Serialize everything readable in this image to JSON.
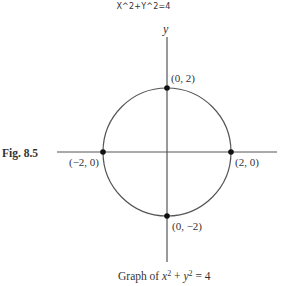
{
  "top_title": "X^2+Y^2=4",
  "figure": {
    "label": "Fig. 8.5",
    "axis_y_label": "y",
    "equation": "x^2 + y^2 = 4",
    "radius": 2,
    "center": [
      0,
      0
    ],
    "points": [
      {
        "label": "(0, 2)",
        "x": 0,
        "y": 2
      },
      {
        "label": "(2, 0)",
        "x": 2,
        "y": 0
      },
      {
        "label": "(−2, 0)",
        "x": -2,
        "y": 0
      },
      {
        "label": "(0, −2)",
        "x": 0,
        "y": -2
      }
    ],
    "caption": {
      "prefix": "Graph of ",
      "x": "x",
      "exp": "2",
      "plus": " + ",
      "y": "y",
      "eq": " = 4"
    }
  },
  "colors": {
    "line": "#555555",
    "point": "#111111",
    "text": "#333333"
  }
}
